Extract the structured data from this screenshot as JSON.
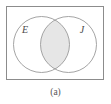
{
  "figure": {
    "caption": "(a)",
    "type": "venn-diagram",
    "universe_label": "",
    "sets": [
      {
        "id": "E",
        "label": "E",
        "label_x": 25,
        "label_y": 33
      },
      {
        "id": "J",
        "label": "J",
        "label_y": 33,
        "label_x": 82
      }
    ],
    "shaded_region": "intersection",
    "colors": {
      "background": "#ffffff",
      "frame_stroke": "#8c8c8c",
      "circle_stroke": "#9a9a9a",
      "shade_fill": "#e6e6e6",
      "label_color": "#4a4a4a",
      "caption_color": "#555555"
    },
    "geometry": {
      "frame": {
        "x": 6,
        "y": 6,
        "width": 98,
        "height": 74
      },
      "circle_left": {
        "cx": 41.5,
        "cy": 44.5,
        "r": 28
      },
      "circle_right": {
        "cx": 68.5,
        "cy": 44.5,
        "r": 28
      },
      "caption": {
        "x": 55.5,
        "y": 95
      }
    }
  }
}
